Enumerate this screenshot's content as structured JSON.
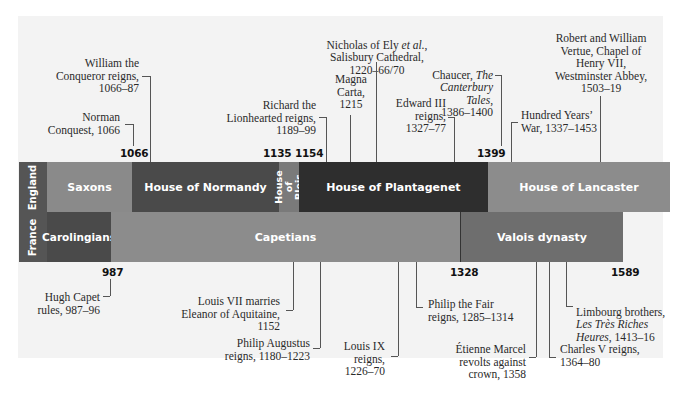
{
  "rows": {
    "england": {
      "label": "England"
    },
    "france": {
      "label": "France"
    }
  },
  "england_bands": [
    {
      "label": "Saxons",
      "color": "#8a8a8a"
    },
    {
      "label": "House of Normandy",
      "color": "#4a4a4a"
    },
    {
      "label": "House\nof Blois",
      "color": "#7a7a7a"
    },
    {
      "label": "House of Plantagenet",
      "color": "#2e2e2e"
    },
    {
      "label": "House of Lancaster",
      "color": "#8c8c8c"
    }
  ],
  "france_bands": [
    {
      "label": "Carolingians",
      "color": "#4a4a4a"
    },
    {
      "label": "Capetians",
      "color": "#8c8c8c"
    },
    {
      "label": "Valois dynasty",
      "color": "#6e6e6e"
    }
  ],
  "top_years": [
    "1066",
    "1135 1154",
    "1399"
  ],
  "bottom_years": [
    "987",
    "1328",
    "1589"
  ],
  "england_events": [
    {
      "text": "William the\nConqueror reigns,\n1066–87"
    },
    {
      "text": "Norman\nConquest, 1066"
    },
    {
      "text": "Richard the\nLionhearted reigns,\n1189–99"
    },
    {
      "text": "Magna\nCarta,\n1215"
    },
    {
      "text": "Nicholas of Ely et al.,\nSalisbury Cathedral,\n1220–66/70"
    },
    {
      "text": "Edward III\nreigns,\n1327–77"
    },
    {
      "text": "Chaucer, The\nCanterbury Tales,\n1386–1400"
    },
    {
      "text": "Hundred Years’\nWar, 1337–1453"
    },
    {
      "text": "Robert and William\nVertue, Chapel of\nHenry VII,\nWestminster Abbey,\n1503–19"
    }
  ],
  "france_events": [
    {
      "text": "Hugh Capet\nrules, 987–96"
    },
    {
      "text": "Louis VII marries\nEleanor of Aquitaine,\n1152"
    },
    {
      "text": "Philip Augustus\nreigns, 1180–1223"
    },
    {
      "text": "Louis IX\nreigns,\n1226–70"
    },
    {
      "text": "Philip the Fair\nreigns, 1285–1314"
    },
    {
      "text": "Étienne Marcel\nrevolts against\ncrown, 1358"
    },
    {
      "text": "Charles V reigns,\n1364–80"
    },
    {
      "text": "Limbourg brothers,\nLes Très Riches\nHeures, 1413–16"
    }
  ]
}
